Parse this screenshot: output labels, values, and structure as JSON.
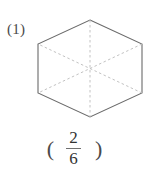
{
  "problem": {
    "label": "(1)"
  },
  "figure": {
    "shape_name": "hexagon",
    "outline_color": "#6b6b6b",
    "partition_line_color": "#c2c2c2",
    "fill_color": "#ffffff",
    "total_parts": 6,
    "shaded_parts": 0,
    "vertices": [
      {
        "x": 90,
        "y": 20
      },
      {
        "x": 142,
        "y": 44
      },
      {
        "x": 142,
        "y": 93
      },
      {
        "x": 90,
        "y": 117
      },
      {
        "x": 38,
        "y": 93
      },
      {
        "x": 38,
        "y": 44
      }
    ],
    "center": {
      "x": 90,
      "y": 68.5
    },
    "diagonals": [
      {
        "from": 0,
        "to": 3
      },
      {
        "from": 1,
        "to": 4
      },
      {
        "from": 2,
        "to": 5
      }
    ]
  },
  "answer": {
    "paren_open": "(",
    "paren_close": ")",
    "numerator": "2",
    "denominator": "6"
  }
}
